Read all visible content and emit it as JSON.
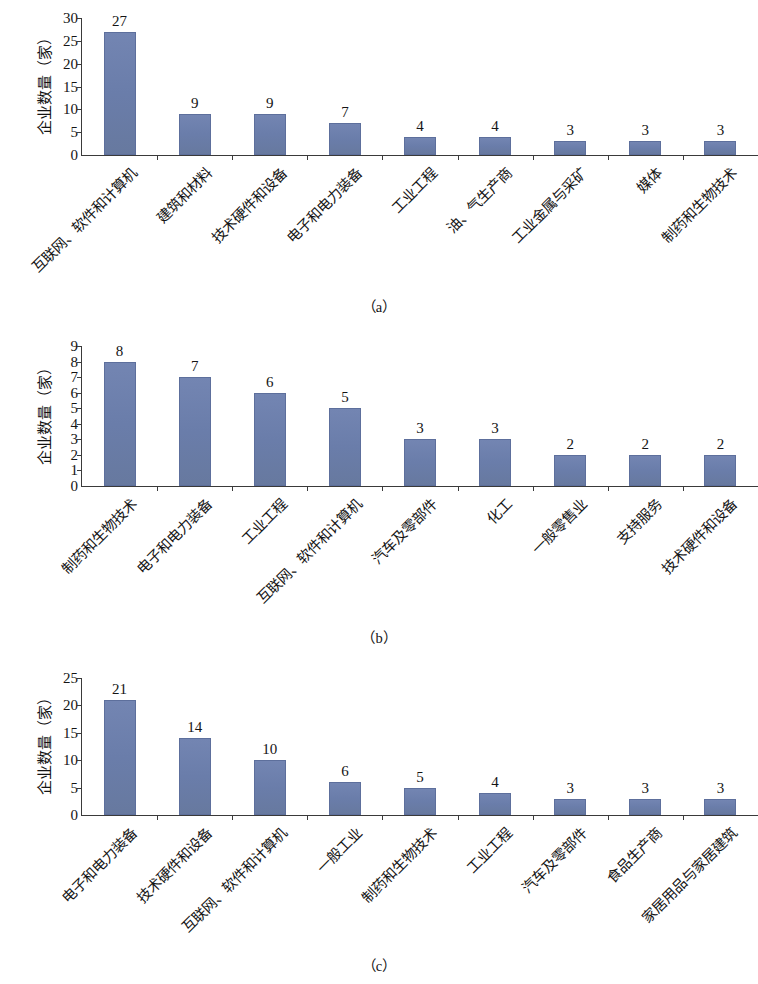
{
  "figure": {
    "bar_color": "#6e80ae",
    "axis_color": "#3a3a3a",
    "text_color": "#141414"
  },
  "panels": [
    {
      "key": "a",
      "caption": "（a）",
      "ylabel": "企业数量（家）",
      "ytick_labels": [
        "0",
        "5",
        "10",
        "15",
        "20",
        "25",
        "30"
      ],
      "categories": [
        "互联网、软件和计算机",
        "建筑和材料",
        "技术硬件和设备",
        "电子和电力装备",
        "工业工程",
        "油、气生产商",
        "工业金属与采矿",
        "媒体",
        "制药和生物技术"
      ],
      "values": [
        27,
        9,
        9,
        7,
        4,
        4,
        3,
        3,
        3
      ],
      "value_labels": [
        "27",
        "9",
        "9",
        "7",
        "4",
        "4",
        "3",
        "3",
        "3"
      ]
    },
    {
      "key": "b",
      "caption": "（b）",
      "ylabel": "企业数量（家）",
      "ytick_labels": [
        "0",
        "1",
        "2",
        "3",
        "4",
        "5",
        "6",
        "7",
        "8",
        "9"
      ],
      "categories": [
        "制药和生物技术",
        "电子和电力装备",
        "工业工程",
        "互联网、软件和计算机",
        "汽车及零部件",
        "化工",
        "一般零售业",
        "支持服务",
        "技术硬件和设备"
      ],
      "values": [
        8,
        7,
        6,
        5,
        3,
        3,
        2,
        2,
        2
      ],
      "value_labels": [
        "8",
        "7",
        "6",
        "5",
        "3",
        "3",
        "2",
        "2",
        "2"
      ]
    },
    {
      "key": "c",
      "caption": "（c）",
      "ylabel": "企业数量（家）",
      "ytick_labels": [
        "0",
        "5",
        "10",
        "15",
        "20",
        "25"
      ],
      "categories": [
        "电子和电力装备",
        "技术硬件和设备",
        "互联网、软件和计算机",
        "一般工业",
        "制药和生物技术",
        "工业工程",
        "汽车及零部件",
        "食品生产商",
        "家居用品与家居建筑"
      ],
      "values": [
        21,
        14,
        10,
        6,
        5,
        4,
        3,
        3,
        3
      ],
      "value_labels": [
        "21",
        "14",
        "10",
        "6",
        "5",
        "4",
        "3",
        "3",
        "3"
      ]
    }
  ],
  "chart_data": [
    {
      "type": "bar",
      "title": "（a）",
      "xlabel": "",
      "ylabel": "企业数量（家）",
      "ylim": [
        0,
        30
      ],
      "ytick_step": 5,
      "grid": false,
      "legend": null,
      "categories": [
        "互联网、软件和计算机",
        "建筑和材料",
        "技术硬件和设备",
        "电子和电力装备",
        "工业工程",
        "油、气生产商",
        "工业金属与采矿",
        "媒体",
        "制药和生物技术"
      ],
      "values": [
        27,
        9,
        9,
        7,
        4,
        4,
        3,
        3,
        3
      ]
    },
    {
      "type": "bar",
      "title": "（b）",
      "xlabel": "",
      "ylabel": "企业数量（家）",
      "ylim": [
        0,
        9
      ],
      "ytick_step": 1,
      "grid": false,
      "legend": null,
      "categories": [
        "制药和生物技术",
        "电子和电力装备",
        "工业工程",
        "互联网、软件和计算机",
        "汽车及零部件",
        "化工",
        "一般零售业",
        "支持服务",
        "技术硬件和设备"
      ],
      "values": [
        8,
        7,
        6,
        5,
        3,
        3,
        2,
        2,
        2
      ]
    },
    {
      "type": "bar",
      "title": "（c）",
      "xlabel": "",
      "ylabel": "企业数量（家）",
      "ylim": [
        0,
        25
      ],
      "ytick_step": 5,
      "grid": false,
      "legend": null,
      "categories": [
        "电子和电力装备",
        "技术硬件和设备",
        "互联网、软件和计算机",
        "一般工业",
        "制药和生物技术",
        "工业工程",
        "汽车及零部件",
        "食品生产商",
        "家居用品与家居建筑"
      ],
      "values": [
        21,
        14,
        10,
        6,
        5,
        4,
        3,
        3,
        3
      ]
    }
  ]
}
